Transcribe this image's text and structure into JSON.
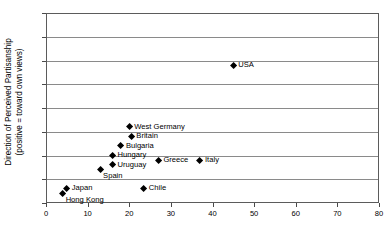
{
  "chart_data": {
    "type": "scatter",
    "title": "",
    "xlabel": "",
    "ylabel_line1": "Direction of Perceived Partisanship",
    "ylabel_line2": "(positive = toward own views)",
    "xlim": [
      0,
      80
    ],
    "ylim": [
      0,
      40
    ],
    "xticks": [
      0,
      10,
      20,
      30,
      40,
      50,
      60,
      70,
      80
    ],
    "yticks": [
      0,
      5,
      10,
      15,
      20,
      25,
      30,
      35,
      40
    ],
    "xtick_labels": [
      "0",
      "10",
      "20",
      "30",
      "40",
      "50",
      "60",
      "70",
      "80"
    ],
    "ytick_labels": [
      "0",
      "5",
      "10",
      "15",
      "20",
      "25",
      "30",
      "35",
      "40"
    ],
    "grid": "horizontal",
    "legend": "none",
    "marker": "filled-diamond",
    "marker_color": "#000000",
    "points": [
      {
        "label": "Hong Kong",
        "x": 4,
        "y": 2,
        "label_pos": "belowright"
      },
      {
        "label": "Japan",
        "x": 5,
        "y": 3,
        "label_pos": "right"
      },
      {
        "label": "Chile",
        "x": 23.5,
        "y": 3,
        "label_pos": "right"
      },
      {
        "label": "Spain",
        "x": 13,
        "y": 7,
        "label_pos": "belowright"
      },
      {
        "label": "Uruguay",
        "x": 16,
        "y": 8,
        "label_pos": "right"
      },
      {
        "label": "Greece",
        "x": 27,
        "y": 9,
        "label_pos": "right"
      },
      {
        "label": "Italy",
        "x": 37,
        "y": 9,
        "label_pos": "right"
      },
      {
        "label": "Hungary",
        "x": 16,
        "y": 10,
        "label_pos": "right"
      },
      {
        "label": "Bulgaria",
        "x": 18,
        "y": 12,
        "label_pos": "right"
      },
      {
        "label": "Britain",
        "x": 20.5,
        "y": 14,
        "label_pos": "right"
      },
      {
        "label": "West Germany",
        "x": 20,
        "y": 16,
        "label_pos": "right"
      },
      {
        "label": "USA",
        "x": 45,
        "y": 29,
        "label_pos": "right"
      }
    ]
  }
}
